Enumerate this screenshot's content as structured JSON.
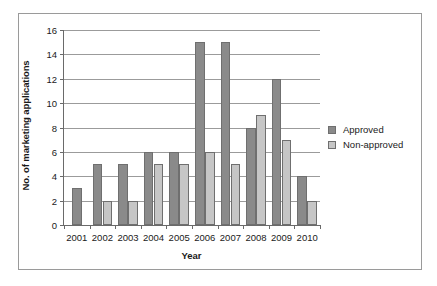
{
  "chart_data": {
    "type": "bar",
    "title": "",
    "xlabel": "Year",
    "ylabel": "No. of marketing applications",
    "categories": [
      "2001",
      "2002",
      "2003",
      "2004",
      "2005",
      "2006",
      "2007",
      "2008",
      "2009",
      "2010"
    ],
    "series": [
      {
        "name": "Approved",
        "color": "#8a8a8a",
        "values": [
          3,
          5,
          5,
          6,
          6,
          15,
          15,
          8,
          12,
          4
        ]
      },
      {
        "name": "Non-approved",
        "color": "#c6c6c6",
        "values": [
          null,
          2,
          2,
          5,
          5,
          6,
          5,
          9,
          7,
          2
        ]
      }
    ],
    "ylim": [
      0,
      16
    ],
    "yticks": [
      0,
      2,
      4,
      6,
      8,
      10,
      12,
      14,
      16
    ],
    "ytick_labels": [
      "0",
      "2",
      "4",
      "6",
      "8",
      "10",
      "12",
      "14",
      "16"
    ],
    "grid": true,
    "legend_position": "right"
  },
  "legend": {
    "items": [
      {
        "label": "Approved"
      },
      {
        "label": "Non-approved"
      }
    ]
  }
}
